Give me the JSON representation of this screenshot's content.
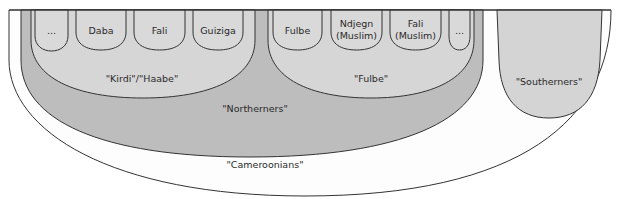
{
  "diagram": {
    "type": "nested-identity-sets",
    "colors": {
      "outer_fill": "#fdfdfd",
      "northerners_fill": "#bdbdbd",
      "group_fill": "#d6d6d6",
      "leaf_fill": "#d9d9d9",
      "southerners_fill": "#d4d4d4",
      "stroke": "#333333"
    },
    "outer": {
      "label": "\"Cameroonians\""
    },
    "northerners": {
      "label": "\"Northerners\""
    },
    "southerners": {
      "label": "\"Southerners\""
    },
    "kirdi": {
      "label": "\"Kirdi\"/\"Haabe\"",
      "members": [
        {
          "line1": "...",
          "line2": ""
        },
        {
          "line1": "Daba",
          "line2": ""
        },
        {
          "line1": "Fali",
          "line2": ""
        },
        {
          "line1": "Guiziga",
          "line2": ""
        }
      ]
    },
    "fulbe": {
      "label": "\"Fulbe\"",
      "members": [
        {
          "line1": "Fulbe",
          "line2": ""
        },
        {
          "line1": "Ndjegn",
          "line2": "(Muslim)"
        },
        {
          "line1": "Fali",
          "line2": "(Muslim)"
        },
        {
          "line1": "...",
          "line2": ""
        }
      ]
    }
  }
}
